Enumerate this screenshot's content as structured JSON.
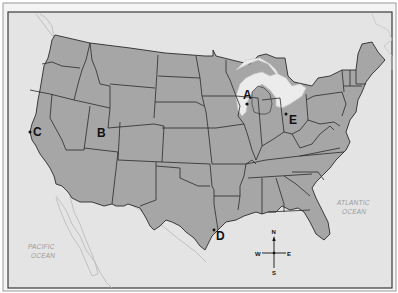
{
  "map": {
    "title": "United States map with labeled points",
    "colors": {
      "land": "#a6a6a6",
      "water": "#e4e4e4",
      "lake": "#ececec",
      "border": "#2a2a2a",
      "frame": "#3a3a3a",
      "outer_background": "#ffffff",
      "ocean_text": "#9a9a9a"
    },
    "points": [
      {
        "label": "A",
        "region": "Wisconsin"
      },
      {
        "label": "B",
        "region": "Utah"
      },
      {
        "label": "C",
        "region": "California coast"
      },
      {
        "label": "D",
        "region": "Texas Gulf coast"
      },
      {
        "label": "E",
        "region": "Ohio"
      }
    ],
    "oceans": {
      "pacific": {
        "line1": "PACIFIC",
        "line2": "OCEAN"
      },
      "atlantic": {
        "line1": "ATLANTIC",
        "line2": "OCEAN"
      }
    },
    "compass": {
      "n": "N",
      "s": "S",
      "e": "E",
      "w": "W"
    }
  }
}
